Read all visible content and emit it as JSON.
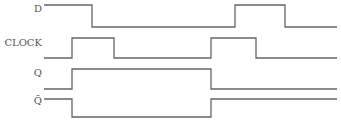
{
  "diagram": {
    "type": "timing-diagram",
    "signals": [
      {
        "name": "D",
        "label": "D",
        "label_pos": [
          8,
          10
        ],
        "points": "44,5 92,5 92,27 235,27 235,5 285,5 285,27 337,27"
      },
      {
        "name": "CLOCK",
        "label": "CLOCK",
        "label_pos": [
          4,
          42
        ],
        "points": "44,58 72,58 72,38 114,38 114,58 211,58 211,38 256,38 256,58 337,58"
      },
      {
        "name": "Q",
        "label": "Q",
        "label_pos": [
          8,
          73
        ],
        "points": "44,89 72,89 72,69 211,69 211,89 337,89"
      },
      {
        "name": "Q-bar",
        "label": "Q̄",
        "label_pos": [
          8,
          100
        ],
        "points": "44,99 72,99 72,117 211,117 211,99 337,99"
      }
    ],
    "colors": {
      "line": "#666666",
      "label": "#555555",
      "background": "#ffffff"
    }
  }
}
